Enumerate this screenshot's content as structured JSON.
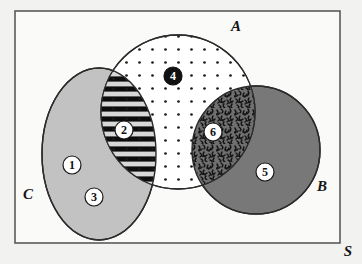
{
  "figure": {
    "type": "venn-diagram",
    "background_color": "#f2f2f0",
    "universe": {
      "label": "S",
      "name": "universal-set-rectangle",
      "border_color": "#5a5a5a",
      "fill_color": "#fafaf8",
      "x": 15,
      "y": 11,
      "width": 325,
      "height": 232,
      "label_x": 348,
      "label_y": 256
    },
    "sets": [
      {
        "id": "A",
        "label": "A",
        "name": "set-a-circle",
        "shape": "circle",
        "cx": 178,
        "cy": 112,
        "r": 77,
        "fill_color": "#ffffff",
        "fill_pattern": "dots",
        "stroke_color": "#2b2b2b",
        "label_x": 236,
        "label_y": 31
      },
      {
        "id": "B",
        "label": "B",
        "name": "set-b-circle",
        "shape": "circle",
        "cx": 256,
        "cy": 150,
        "r": 64,
        "fill_color": "#787878",
        "fill_pattern": "solid",
        "stroke_color": "#2b2b2b",
        "label_x": 322,
        "label_y": 191
      },
      {
        "id": "C",
        "label": "C",
        "name": "set-c-ellipse",
        "shape": "ellipse",
        "cx": 99,
        "cy": 154,
        "rx": 57,
        "ry": 86,
        "fill_color": "#c2c2c2",
        "fill_pattern": "solid",
        "stroke_color": "#2b2b2b",
        "label_x": 28,
        "label_y": 199
      }
    ],
    "regions": [
      {
        "number": "1",
        "name": "region-1-c-only-upper",
        "description": "C only",
        "marker_style": "white-circle-black-text",
        "cx": 72,
        "cy": 165,
        "r": 9
      },
      {
        "number": "2",
        "name": "region-2-a-intersect-c",
        "description": "A and C",
        "marker_style": "white-circle-black-text",
        "fill_pattern": "horizontal-stripes-with-dots",
        "cx": 124,
        "cy": 130,
        "r": 9
      },
      {
        "number": "3",
        "name": "region-3-c-only-lower",
        "description": "C only",
        "marker_style": "white-circle-black-text",
        "cx": 94,
        "cy": 197,
        "r": 9
      },
      {
        "number": "4",
        "name": "region-4-a-only",
        "description": "A only",
        "marker_style": "black-circle-white-text",
        "fill_pattern": "dots",
        "cx": 173,
        "cy": 76,
        "r": 9
      },
      {
        "number": "5",
        "name": "region-5-b-only",
        "description": "B only",
        "marker_style": "white-circle-black-text",
        "cx": 265,
        "cy": 172,
        "r": 9
      },
      {
        "number": "6",
        "name": "region-6-a-intersect-b",
        "description": "A and B",
        "marker_style": "white-circle-black-text",
        "fill_pattern": "dense-scribble",
        "cx": 213,
        "cy": 132,
        "r": 9
      }
    ],
    "patterns": {
      "dot_color": "#1a1a1a",
      "dot_spacing": 13,
      "dot_radius": 1.3,
      "stripe_color": "#0d0d0d",
      "stripe_bg_color": "#d8d8d8",
      "stripe_period": 10,
      "scribble_color": "#141414",
      "scribble_bg_color": "#6f6f6f"
    }
  }
}
